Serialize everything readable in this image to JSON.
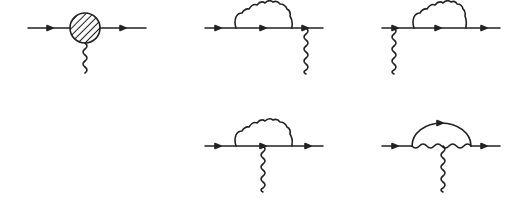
{
  "figure": {
    "stroke_color": "#222222",
    "background": "#ffffff"
  },
  "diagrams": [
    {
      "id": "blob-vertex",
      "label": "Effective vertex with external photon",
      "fermion_line": [
        28,
        146
      ],
      "y": 28,
      "blob_center": 85,
      "photon_x": 85
    },
    {
      "id": "self-energy-before-vertex",
      "label": "Self-energy insertion on incoming leg, photon on outgoing leg",
      "fermion_line": [
        205,
        323
      ],
      "y": 28,
      "loop": [
        236,
        291
      ],
      "photon_x": 306
    },
    {
      "id": "self-energy-after-vertex",
      "label": "Photon on incoming leg, self-energy insertion on outgoing leg",
      "fermion_line": [
        382,
        500
      ],
      "y": 28,
      "loop": [
        414,
        466
      ],
      "photon_x": 394
    },
    {
      "id": "photon-inside-loop-on-fermion",
      "label": "Photon attached to internal fermion inside loop",
      "fermion_line": [
        205,
        323
      ],
      "y": 146,
      "loop": [
        236,
        291
      ],
      "photon_x": 263
    },
    {
      "id": "photon-on-internal-boson",
      "label": "Vertex correction with photon attached to internal boson line",
      "fermion_line": [
        382,
        500
      ],
      "y": 146,
      "arc": [
        412,
        471
      ],
      "photon_x": 443
    }
  ]
}
